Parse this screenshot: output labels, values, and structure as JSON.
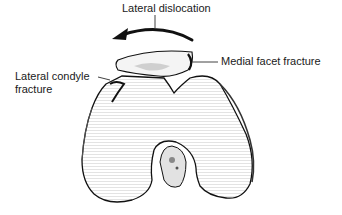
{
  "diagram": {
    "labels": {
      "lateral_dislocation": "Lateral dislocation",
      "medial_facet_fracture": "Medial facet fracture",
      "lateral_condyle_line1": "Lateral condyle",
      "lateral_condyle_line2": "fracture"
    },
    "colors": {
      "ink": "#111111",
      "shading": "#bdbdbd",
      "background": "#ffffff"
    }
  }
}
